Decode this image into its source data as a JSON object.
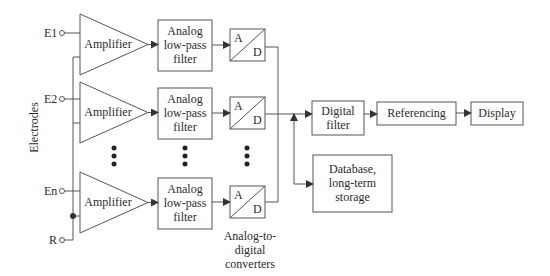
{
  "diagram": {
    "type": "block-diagram",
    "side_label": "Electrodes",
    "electrodes": [
      {
        "id": "E1",
        "label": "E1"
      },
      {
        "id": "E2",
        "label": "E2"
      },
      {
        "id": "En",
        "label": "En"
      },
      {
        "id": "R",
        "label": "R"
      }
    ],
    "channels": [
      {
        "amplifier": "Amplifier",
        "filter_lines": [
          "Analog",
          "low-pass",
          "filter"
        ],
        "adc_a": "A",
        "adc_d": "D"
      },
      {
        "amplifier": "Amplifier",
        "filter_lines": [
          "Analog",
          "low-pass",
          "filter"
        ],
        "adc_a": "A",
        "adc_d": "D"
      },
      {
        "amplifier": "Amplifier",
        "filter_lines": [
          "Analog",
          "low-pass",
          "filter"
        ],
        "adc_a": "A",
        "adc_d": "D"
      }
    ],
    "adc_caption_lines": [
      "Analog-to-",
      "digital",
      "converters"
    ],
    "digital_filter_lines": [
      "Digital",
      "filter"
    ],
    "referencing": "Referencing",
    "display": "Display",
    "database_lines": [
      "Database,",
      "long-term",
      "storage"
    ],
    "ellipsis": "⋮",
    "edges": [
      [
        "E1",
        "Amplifier 1"
      ],
      [
        "E2",
        "Amplifier 2"
      ],
      [
        "En",
        "Amplifier n"
      ],
      [
        "R",
        "Amplifier 1/2/n (reference)"
      ],
      [
        "Amplifier",
        "Analog low-pass filter"
      ],
      [
        "Analog low-pass filter",
        "A/D"
      ],
      [
        "A/D",
        "Digital filter"
      ],
      [
        "A/D",
        "Database, long-term storage"
      ],
      [
        "Digital filter",
        "Referencing"
      ],
      [
        "Referencing",
        "Display"
      ]
    ],
    "colors": {
      "stroke": "#555555",
      "text": "#2b2b2b",
      "background": "#ffffff"
    }
  }
}
